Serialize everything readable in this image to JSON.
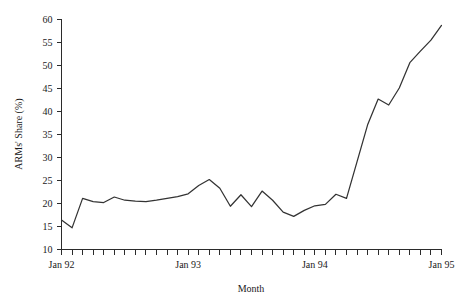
{
  "chart_data": {
    "type": "line",
    "title": "",
    "xlabel": "Month",
    "ylabel": "ARMs' Share (%)",
    "ylim": [
      10,
      60
    ],
    "ytick_labels": [
      "10",
      "15",
      "20",
      "25",
      "30",
      "35",
      "40",
      "45",
      "50",
      "55",
      "60"
    ],
    "ytick_values": [
      10,
      15,
      20,
      25,
      30,
      35,
      40,
      45,
      50,
      55,
      60
    ],
    "xtick_labels": [
      "Jan 92",
      "Jan 93",
      "Jan 94",
      "Jan 95"
    ],
    "xtick_label_positions": [
      0,
      12,
      24,
      36
    ],
    "grid": false,
    "legend": false,
    "x": [
      "Jan 92",
      "Feb 92",
      "Mar 92",
      "Apr 92",
      "May 92",
      "Jun 92",
      "Jul 92",
      "Aug 92",
      "Sep 92",
      "Oct 92",
      "Nov 92",
      "Dec 92",
      "Jan 93",
      "Feb 93",
      "Mar 93",
      "Apr 93",
      "May 93",
      "Jun 93",
      "Jul 93",
      "Aug 93",
      "Sep 93",
      "Oct 93",
      "Nov 93",
      "Dec 93",
      "Jan 94",
      "Feb 94",
      "Mar 94",
      "Apr 94",
      "May 94",
      "Jun 94",
      "Jul 94",
      "Aug 94",
      "Sep 94",
      "Oct 94",
      "Nov 94",
      "Dec 94",
      "Jan 95"
    ],
    "series": [
      {
        "name": "ARMs' Share",
        "values": [
          16.3,
          14.6,
          21.0,
          20.3,
          20.1,
          21.3,
          20.6,
          20.4,
          20.3,
          20.6,
          21.0,
          21.4,
          22.0,
          23.8,
          25.1,
          23.2,
          19.3,
          21.8,
          19.2,
          22.6,
          20.6,
          18.0,
          17.1,
          18.4,
          19.4,
          19.7,
          21.9,
          21.0,
          29.0,
          37.0,
          42.6,
          41.3,
          45.0,
          50.5,
          53.0,
          55.4,
          58.6
        ]
      }
    ],
    "total_months": 37
  },
  "colors": {
    "line": "#333333",
    "axis": "#2b2b2b",
    "background": "#ffffff",
    "text": "#1a1a1a"
  }
}
